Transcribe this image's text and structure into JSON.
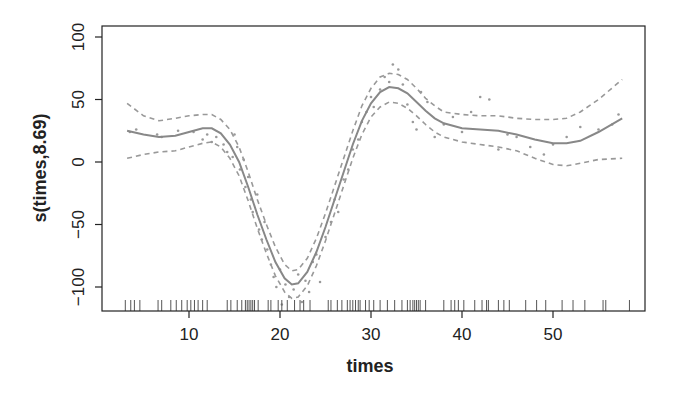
{
  "chart_data": {
    "type": "line",
    "title": "",
    "xlabel": "times",
    "ylabel": "s(times,8.69)",
    "xlim": [
      2.4,
      60
    ],
    "ylim": [
      -120,
      104
    ],
    "x_ticks": [
      10,
      20,
      30,
      40,
      50
    ],
    "y_ticks": [
      -100,
      -50,
      0,
      50,
      100
    ],
    "x_tick_labels": [
      "10",
      "20",
      "30",
      "40",
      "50"
    ],
    "y_tick_labels": [
      "-100",
      "-50",
      "0",
      "50",
      "100"
    ],
    "grid": false,
    "legend": null,
    "series": [
      {
        "name": "smooth fit",
        "style": "solid",
        "x": [
          3.2,
          5,
          6.7,
          8.5,
          10,
          11.5,
          12.5,
          13.5,
          14.5,
          15.5,
          16.5,
          17.5,
          18.5,
          19.5,
          20.5,
          21.3,
          22,
          23,
          24,
          25,
          26,
          27,
          28,
          29,
          30,
          31,
          32,
          33,
          34,
          35,
          36,
          37,
          38,
          40,
          42,
          44,
          46,
          48,
          50,
          51.5,
          53,
          55,
          57.6
        ],
        "y": [
          25,
          22,
          20,
          21,
          24,
          27,
          27,
          23,
          14,
          0,
          -20,
          -42,
          -62,
          -80,
          -93,
          -98,
          -97,
          -88,
          -72,
          -52,
          -30,
          -8,
          14,
          33,
          47,
          56,
          60,
          59,
          55,
          48,
          41,
          35,
          31,
          27,
          26,
          25,
          22,
          18,
          15,
          15,
          17,
          24,
          35
        ]
      },
      {
        "name": "upper 95% band",
        "style": "dashed",
        "x": [
          3.2,
          5,
          6.7,
          8.5,
          10,
          11.5,
          12.5,
          13.5,
          14.5,
          15.5,
          16.5,
          17.5,
          18.5,
          19.5,
          20.5,
          21.3,
          22,
          23,
          24,
          25,
          26,
          27,
          28,
          29,
          30,
          31,
          32,
          33,
          34,
          35,
          36,
          37,
          38,
          40,
          42,
          44,
          46,
          48,
          50,
          51.5,
          53,
          55,
          57.6
        ],
        "y": [
          47,
          37,
          33,
          35,
          37,
          38,
          38,
          34,
          26,
          12,
          -8,
          -30,
          -50,
          -68,
          -82,
          -87,
          -86,
          -77,
          -61,
          -41,
          -19,
          3,
          25,
          45,
          59,
          68,
          71,
          70,
          66,
          59,
          51,
          45,
          40,
          38,
          37,
          37,
          35,
          34,
          34,
          35,
          40,
          50,
          66
        ]
      },
      {
        "name": "lower 95% band",
        "style": "dashed",
        "x": [
          3.2,
          5,
          6.7,
          8.5,
          10,
          11.5,
          12.5,
          13.5,
          14.5,
          15.5,
          16.5,
          17.5,
          18.5,
          19.5,
          20.5,
          21.3,
          22,
          23,
          24,
          25,
          26,
          27,
          28,
          29,
          30,
          31,
          32,
          33,
          34,
          35,
          36,
          37,
          38,
          40,
          42,
          44,
          46,
          48,
          50,
          51.5,
          53,
          55,
          57.6
        ],
        "y": [
          3,
          6,
          8,
          9,
          12,
          15,
          16,
          12,
          3,
          -11,
          -31,
          -53,
          -73,
          -91,
          -104,
          -109,
          -108,
          -99,
          -83,
          -63,
          -41,
          -19,
          3,
          22,
          36,
          44,
          48,
          47,
          43,
          37,
          30,
          24,
          20,
          16,
          14,
          12,
          9,
          3,
          -2,
          -3,
          -1,
          2,
          3
        ]
      }
    ],
    "scatter": {
      "name": "partial residuals",
      "x": [
        3.5,
        4.2,
        6.5,
        7,
        8.8,
        10.5,
        11.5,
        12,
        12.5,
        13,
        13.8,
        14.2,
        14.8,
        15,
        15.3,
        15.6,
        16,
        16.2,
        16.5,
        16.8,
        17,
        17.5,
        17.7,
        18,
        18.3,
        18.6,
        19,
        19.3,
        19.6,
        20,
        20.2,
        20.6,
        21,
        21.5,
        22,
        22.4,
        22.8,
        23.2,
        23.6,
        24,
        24.4,
        25,
        25.6,
        26,
        26.4,
        27,
        27.5,
        28,
        28.6,
        29,
        29.5,
        30,
        30.3,
        31,
        31.5,
        32,
        32.4,
        33,
        33.5,
        34,
        34.6,
        35,
        35.5,
        36.2,
        37,
        38,
        39,
        40,
        41,
        42,
        43,
        44,
        45,
        46,
        47.5,
        49,
        50,
        51.5,
        53,
        55,
        56.5,
        57.2
      ],
      "y": [
        24,
        26,
        22,
        20,
        25,
        24,
        18,
        22,
        16,
        20,
        14,
        8,
        4,
        22,
        12,
        -6,
        2,
        -20,
        -12,
        -30,
        -40,
        -26,
        -54,
        -62,
        -48,
        -70,
        -82,
        -92,
        -100,
        -86,
        -114,
        -98,
        -108,
        -102,
        -90,
        -112,
        -95,
        -104,
        -80,
        -74,
        -96,
        -60,
        -48,
        -30,
        -40,
        -14,
        -6,
        10,
        18,
        32,
        40,
        52,
        44,
        58,
        68,
        64,
        78,
        74,
        62,
        46,
        32,
        26,
        56,
        48,
        20,
        30,
        36,
        24,
        40,
        52,
        50,
        10,
        22,
        20,
        12,
        6,
        14,
        20,
        28,
        26,
        30,
        38
      ],
      "color": "#999999"
    },
    "rug": [
      3,
      3.6,
      4,
      4.6,
      6.6,
      7,
      8,
      8.6,
      9.2,
      9.8,
      10.2,
      10.6,
      11,
      11.5,
      12,
      14.2,
      14.6,
      15.3,
      15.8,
      16.2,
      16.4,
      16.6,
      16.8,
      17,
      17.2,
      17.6,
      18.7,
      19,
      19.8,
      20.2,
      20.8,
      21.6,
      22.2,
      22.6,
      23.3,
      25.3,
      25.6,
      26.3,
      26.8,
      27.4,
      27.7,
      28,
      28.3,
      28.6,
      28.8,
      29.4,
      29.8,
      30.3,
      31,
      31.8,
      32.6,
      33.4,
      34,
      34.3,
      34.6,
      34.8,
      35,
      35.2,
      35.4,
      36,
      38,
      38.8,
      39.2,
      39.6,
      40.2,
      41.4,
      42.2,
      42.7,
      42.9,
      44,
      44.6,
      45.2,
      47,
      48.2,
      49.2,
      51,
      52.2,
      53.5,
      55.5,
      55.8,
      58.4
    ],
    "colors": {
      "fit": "#888888",
      "band": "#999999",
      "axis": "#222222"
    }
  }
}
